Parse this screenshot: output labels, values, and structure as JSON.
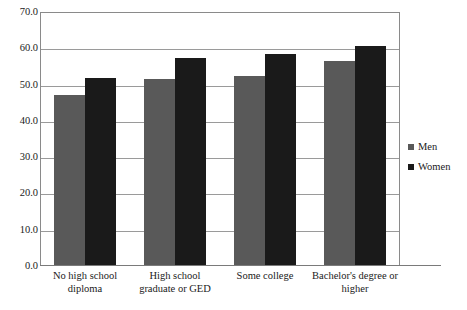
{
  "chart_data": {
    "type": "bar",
    "title": "",
    "subtitle": "",
    "xlabel": "",
    "ylabel": "",
    "ylim": [
      0.0,
      70.0
    ],
    "grid": true,
    "legend_position": "right",
    "categories": [
      "No high school diploma",
      "High school graduate or GED",
      "Some college",
      "Bachelor's degree or higher"
    ],
    "category_lines": [
      [
        "No high school",
        "diploma"
      ],
      [
        "High school",
        "graduate or GED"
      ],
      [
        "Some college",
        ""
      ],
      [
        "Bachelor's degree or",
        "higher"
      ]
    ],
    "series": [
      {
        "name": "Men",
        "color": "#595959",
        "values": [
          47.2,
          51.5,
          52.5,
          56.5
        ]
      },
      {
        "name": "Women",
        "color": "#1a1a1a",
        "values": [
          51.8,
          57.2,
          58.5,
          60.5
        ]
      }
    ],
    "y_ticks": [
      "0.0",
      "10.0",
      "20.0",
      "30.0",
      "40.0",
      "50.0",
      "60.0",
      "70.0"
    ],
    "y_tick_values": [
      0.0,
      10.0,
      20.0,
      30.0,
      40.0,
      50.0,
      60.0,
      70.0
    ]
  },
  "legend": {
    "items": [
      {
        "label": "Men",
        "swatch": "men-swatch"
      },
      {
        "label": "Women",
        "swatch": "women-swatch"
      }
    ]
  }
}
